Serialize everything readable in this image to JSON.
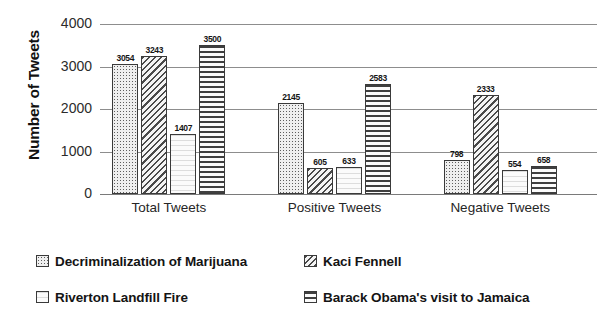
{
  "chart_data": {
    "type": "bar",
    "title": "",
    "xlabel": "",
    "ylabel": "Number of Tweets",
    "ylim": [
      0,
      4000
    ],
    "yticks": [
      0,
      1000,
      2000,
      3000,
      4000
    ],
    "ytick_labels": [
      "0",
      "1000",
      "2000",
      "3000",
      "4000"
    ],
    "grid": true,
    "legend_position": "bottom",
    "categories": [
      "Total Tweets",
      "Positive Tweets",
      "Negative Tweets"
    ],
    "series": [
      {
        "name": "Decriminalization of Marijuana",
        "pattern": "dotted-grid",
        "values": [
          3054,
          2145,
          798
        ],
        "labels": [
          "3054",
          "2145",
          "798"
        ]
      },
      {
        "name": "Kaci Fennell",
        "pattern": "diagonal-hatch",
        "values": [
          3243,
          605,
          2333
        ],
        "labels": [
          "3243",
          "605",
          "2333"
        ]
      },
      {
        "name": "Riverton Landfill Fire",
        "pattern": "light-wavy",
        "values": [
          1407,
          633,
          554
        ],
        "labels": [
          "1407",
          "633",
          "554"
        ]
      },
      {
        "name": "Barack Obama's visit to Jamaica",
        "pattern": "horizontal-stripes",
        "values": [
          3500,
          2583,
          658
        ],
        "labels": [
          "3500",
          "2583",
          "658"
        ]
      }
    ]
  },
  "colors": {
    "background": "#ffffff",
    "gridline": "#8d8d8d",
    "bar_border": "#3a3a3a",
    "text": "#1a1a1a"
  }
}
